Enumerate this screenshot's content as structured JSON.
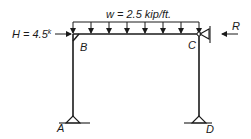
{
  "diagram": {
    "type": "portal-frame",
    "distributed_load": {
      "label": "w = 2.5 kip/ft.",
      "symbol": "w",
      "value": "2.5",
      "unit": "kip/ft.",
      "arrow_count": 8
    },
    "horizontal_load": {
      "label_main": "H = 4.5",
      "label_sup": "k",
      "symbol": "H",
      "value": "4.5",
      "unit": "k",
      "direction": "right"
    },
    "reaction": {
      "label": "R",
      "direction": "left"
    },
    "joints": {
      "B": "B",
      "C": "C"
    },
    "supports": {
      "A": "A",
      "D": "D"
    },
    "colors": {
      "line": "#1a1a1a",
      "background": "#ffffff"
    }
  }
}
